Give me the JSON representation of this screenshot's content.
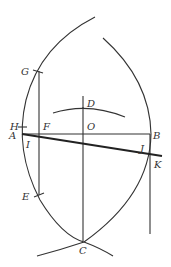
{
  "diagram": {
    "type": "geometric-construction",
    "labels": {
      "A": "A",
      "B": "B",
      "C": "C",
      "D": "D",
      "E": "E",
      "F": "F",
      "G": "G",
      "H": "H",
      "I": "I",
      "J": "J",
      "K": "K",
      "O": "O"
    },
    "points": {
      "A": [
        22,
        134
      ],
      "B": [
        150,
        134
      ],
      "C": [
        83,
        241
      ],
      "D": [
        83,
        108
      ],
      "E": [
        38,
        195
      ],
      "F": [
        39,
        134
      ],
      "G": [
        37,
        71
      ],
      "H": [
        22,
        127
      ],
      "I": [
        30,
        137
      ],
      "J": [
        147,
        154
      ],
      "K": [
        155,
        156
      ],
      "O": [
        83,
        134
      ]
    },
    "stroke_color": "#333333",
    "background": "#ffffff"
  }
}
